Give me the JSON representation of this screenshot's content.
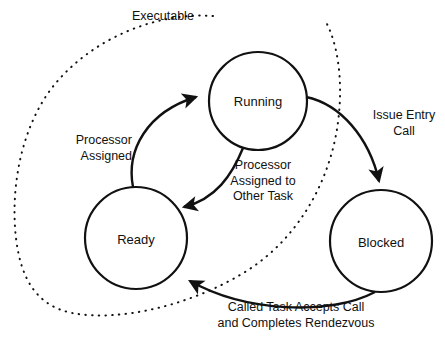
{
  "diagram": {
    "type": "state-transition-diagram",
    "title": "",
    "colors": {
      "stroke": "#111111",
      "background": "#ffffff",
      "text": "#111111"
    },
    "states": [
      {
        "id": "running",
        "label": "Running",
        "cx": 258,
        "cy": 101,
        "r": 49
      },
      {
        "id": "ready",
        "label": "Ready",
        "cx": 136,
        "cy": 238,
        "r": 51
      },
      {
        "id": "blocked",
        "label": "Blocked",
        "cx": 381,
        "cy": 241,
        "r": 51
      }
    ],
    "transitions": [
      {
        "id": "ready-to-running",
        "from": "ready",
        "to": "running",
        "style": "solid",
        "label": "Processor\nAssigned",
        "label_line1": "Processor",
        "label_line2": "Assigned"
      },
      {
        "id": "running-to-ready",
        "from": "running",
        "to": "ready",
        "style": "solid",
        "label": "Processor\nAssigned to\nOther Task",
        "label_line1": "Processor",
        "label_line2": "Assigned to",
        "label_line3": "Other Task"
      },
      {
        "id": "running-to-blocked",
        "from": "running",
        "to": "blocked",
        "style": "solid",
        "label": "Issue Entry\nCall",
        "label_line1": "Issue Entry",
        "label_line2": "Call"
      },
      {
        "id": "blocked-to-ready",
        "from": "blocked",
        "to": "ready",
        "style": "solid",
        "label": "Called Task Accepts Call\nand Completes Rendezvous",
        "label_line1": "Called Task Accepts Call",
        "label_line2": "and Completes Rendezvous"
      },
      {
        "id": "executable-envelope",
        "from": "ready",
        "to": "running",
        "style": "dotted",
        "label": "Executable",
        "label_line1": "Executable",
        "note": "dotted enclosure grouping Ready and Running states"
      }
    ]
  }
}
